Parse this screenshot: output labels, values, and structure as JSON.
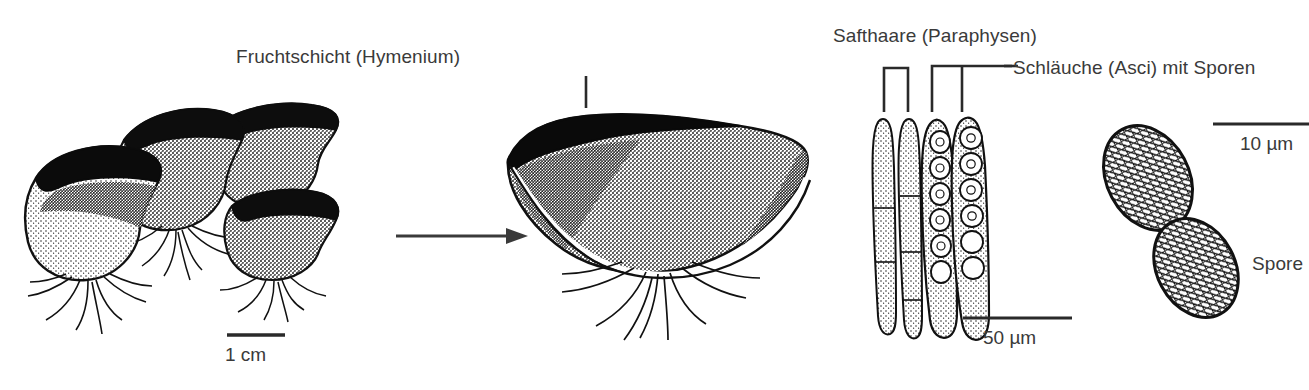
{
  "figure": {
    "background_color": "#ffffff",
    "ink_color": "#1a1a1a",
    "text_color": "#3a3a3a",
    "width": 1309,
    "height": 390
  },
  "labels": {
    "hymenium": "Fruchtschicht (Hymenium)",
    "paraphysen": "Safthaare (Paraphysen)",
    "asci": "Schläuche (Asci) mit Sporen",
    "spore": "Spore"
  },
  "scale_bars": [
    {
      "id": "scale-1cm",
      "text": "1 cm"
    },
    {
      "id": "scale-50um",
      "text": "50 µm"
    },
    {
      "id": "scale-10um",
      "text": "10 µm"
    }
  ],
  "panels": [
    {
      "id": "fruiting-body-cluster",
      "caption": "1 cm",
      "description": "Gruppe von becherförmigen Fruchtkörpern mit Myzelfäden"
    },
    {
      "id": "single-fruiting-body",
      "caption": "Fruchtschicht (Hymenium)",
      "description": "Vergrößerter einzelner Fruchtkörper (Apothecium)"
    },
    {
      "id": "asci-paraphyses",
      "caption": "50 µm",
      "description": "Zwei Safthaare und zwei Schläuche mit Sporenreihe"
    },
    {
      "id": "spores",
      "caption": "10 µm",
      "description": "Zwei ornamentierte Sporen"
    }
  ],
  "arrow": {
    "id": "magnify-arrow",
    "direction": "right",
    "meaning": "Vergrößerung"
  },
  "counts": {
    "fruiting_bodies_in_cluster": 4,
    "paraphyses_drawn": 2,
    "asci_drawn": 2,
    "spores_drawn": 2
  }
}
